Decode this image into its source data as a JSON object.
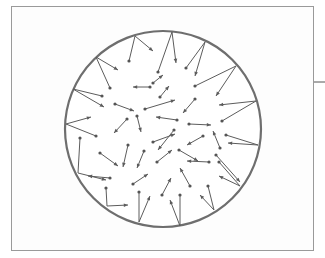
{
  "diagram": {
    "container_shape": "circle",
    "free_molecule_count": 33,
    "wall_collision_count": 14,
    "colors": {
      "container_wall": "#6e6e6e",
      "vector": "#5c5c5c",
      "frame": "#9a9a9a",
      "background": "#ffffff"
    },
    "legend": []
  }
}
